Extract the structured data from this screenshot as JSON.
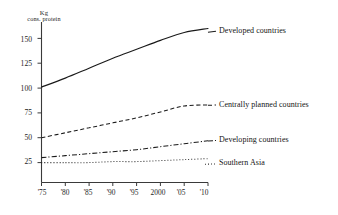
{
  "chart_data": {
    "type": "line",
    "title": "",
    "subtitle": "",
    "xlabel": "",
    "ylabel": "Kg cons. protein",
    "ylabel_lines": [
      "Kg",
      "cons. protein"
    ],
    "x": [
      1975,
      1980,
      1985,
      1990,
      1995,
      2000,
      2005,
      2010
    ],
    "xtick_labels": [
      "'75",
      "'80",
      "'85",
      "'90",
      "'95",
      "2000",
      "'05",
      "'10"
    ],
    "ytick_labels": [
      "25",
      "50",
      "75",
      "100",
      "125",
      "150"
    ],
    "ytick_values": [
      25,
      50,
      75,
      100,
      125,
      150
    ],
    "ylim": [
      0,
      170
    ],
    "xlim": [
      1975,
      2010
    ],
    "grid": false,
    "legend_position": "right-inline-labels",
    "series": [
      {
        "name": "Developed countries",
        "label": "Developed countries",
        "style": "solid",
        "color": "#1a1a1a",
        "values": [
          101,
          110,
          120,
          130,
          139,
          148,
          156,
          160
        ]
      },
      {
        "name": "Centrally planned countries",
        "label": "Centrally planned countries",
        "style": "dashed",
        "color": "#1a1a1a",
        "values": [
          50,
          55,
          60,
          65,
          70,
          76,
          82,
          83
        ]
      },
      {
        "name": "Developing countries",
        "label": "Developing countries",
        "style": "dash-dot",
        "color": "#1a1a1a",
        "values": [
          30,
          32,
          34,
          36,
          38,
          41,
          44,
          47
        ]
      },
      {
        "name": "Southern Asia",
        "label": "Southern Asia",
        "style": "dotted",
        "color": "#1a1a1a",
        "values": [
          25,
          25,
          25,
          26,
          26,
          27,
          28,
          29
        ]
      }
    ]
  },
  "axis": {
    "unit_line_1": "Kg",
    "unit_line_2": "cons. protein"
  }
}
